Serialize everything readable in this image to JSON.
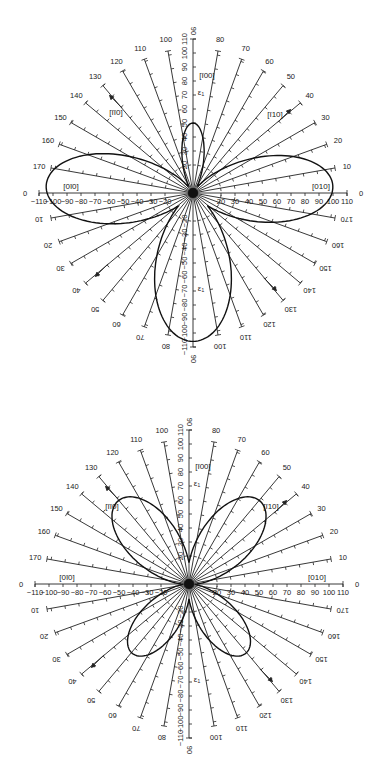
{
  "figure": {
    "spoke_step_deg": 10,
    "scale_max": 110,
    "scale_step": 10
  },
  "plots": [
    {
      "id": "top",
      "center": [
        193,
        193
      ],
      "px_per_unit": 1.4,
      "direction_labels": {
        "up": "[ī00]",
        "right": "[010]",
        "left": "[0ī0]",
        "upper_left": "[īī0]",
        "upper_right": "[ī10]",
        "axis_symbol_up": "ε₁",
        "axis_symbol_down": "ε₁"
      },
      "horizontal_tick_labels": [
        "-110",
        "-100",
        "-90",
        "-80",
        "-70",
        "-60",
        "-50",
        "-40",
        "-30",
        "-20",
        "20",
        "30",
        "40",
        "50",
        "60",
        "70",
        "80",
        "90",
        "100",
        "110"
      ],
      "vertical_tick_labels": [
        "110",
        "100",
        "90",
        "80",
        "70",
        "60",
        "50",
        "40",
        "30",
        "20",
        "-20",
        "-30",
        "-40",
        "-50",
        "-60",
        "-70",
        "-80",
        "-90",
        "-100",
        "-110"
      ],
      "spoke_angle_labels_left": [
        "170",
        "160",
        "150",
        "140",
        "130",
        "120",
        "110",
        "100"
      ],
      "spoke_angle_labels_right": [
        "80",
        "70",
        "60",
        "50",
        "40",
        "30",
        "20",
        "10"
      ],
      "end_labels": {
        "left": "0",
        "right": "0",
        "top": "90",
        "bottom": "90"
      },
      "curve_shape": "four-lobe: small upper lobe (~50), left lobe (~105), right lobe (~100), large lower lobe (~105)"
    },
    {
      "id": "bottom",
      "center": [
        189,
        194
      ],
      "px_per_unit": 1.4,
      "direction_labels": {
        "up": "[ī00]",
        "right": "[010]",
        "left": "[0ī0]",
        "upper_left": "[īī0]",
        "upper_right": "[ī10]",
        "axis_symbol_up": "ε₁",
        "axis_symbol_down": "ε₁"
      },
      "horizontal_tick_labels": [
        "-110",
        "-100",
        "-90",
        "-80",
        "-70",
        "-60",
        "-50",
        "-40",
        "-30",
        "-20",
        "20",
        "30",
        "40",
        "50",
        "60",
        "70",
        "80",
        "90",
        "100",
        "110"
      ],
      "vertical_tick_labels": [
        "110",
        "100",
        "90",
        "80",
        "70",
        "60",
        "50",
        "40",
        "30",
        "20",
        "-20",
        "-30",
        "-40",
        "-50",
        "-60",
        "-70",
        "-80",
        "-90",
        "-100",
        "-110"
      ],
      "spoke_angle_labels_left": [
        "170",
        "160",
        "150",
        "140",
        "130",
        "120",
        "110",
        "100"
      ],
      "spoke_angle_labels_right": [
        "80",
        "70",
        "60",
        "50",
        "40",
        "30",
        "20",
        "10"
      ],
      "end_labels": {
        "left": "0",
        "right": "0",
        "top": "90",
        "bottom": "90"
      },
      "curve_shape": "four-leaf clover: lobes along 45 deg diagonals, upper lobes ~75, lower lobes ~60"
    }
  ]
}
